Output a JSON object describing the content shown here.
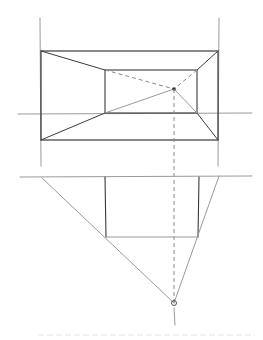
{
  "drawing": {
    "subject": "one-point perspective construction sketch",
    "colors": {
      "background": "#ffffff",
      "ink": "#3a3a3a",
      "construction": "#9a9a9a",
      "dashed": "#8a8a8a"
    },
    "top_view": {
      "guide_verticals": [
        [
          40,
          18,
          41,
          166
        ],
        [
          219,
          18,
          218,
          166
        ]
      ],
      "outer_rect": [
        41,
        51,
        218,
        140
      ],
      "inner_rect": [
        105,
        70,
        197,
        113
      ],
      "vanishing_point": [
        174,
        89
      ],
      "horizon_line": [
        18,
        114,
        252,
        113
      ]
    },
    "bottom_view": {
      "ground_line": [
        20,
        177,
        252,
        176
      ],
      "rect": [
        105,
        177,
        199,
        237
      ],
      "vanishing_point": [
        174,
        303
      ],
      "station_tick": [
        174,
        306,
        175,
        325
      ]
    },
    "marks": {
      "vp_symbol": "✳",
      "station_symbol": "⊕"
    }
  }
}
